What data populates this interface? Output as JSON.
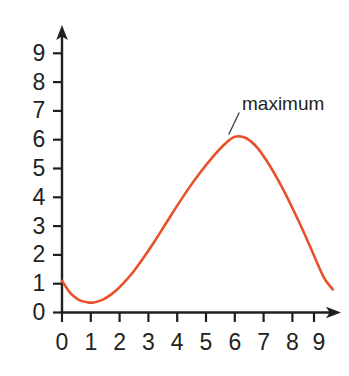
{
  "chart_data": {
    "type": "line",
    "title": "",
    "xlabel": "",
    "ylabel": "",
    "xlim": [
      0,
      9.6
    ],
    "ylim": [
      0,
      9.6
    ],
    "grid": false,
    "legend": "none",
    "x_ticks": [
      "0",
      "1",
      "2",
      "3",
      "4",
      "5",
      "6",
      "7",
      "8",
      "9"
    ],
    "y_ticks": [
      "0",
      "1",
      "2",
      "3",
      "4",
      "5",
      "6",
      "7",
      "8",
      "9"
    ],
    "x_tick_values": [
      0,
      1,
      2,
      3,
      4,
      5,
      6,
      7,
      8,
      9
    ],
    "y_tick_values": [
      0,
      1,
      2,
      3,
      4,
      5,
      6,
      7,
      8,
      9
    ],
    "series": [
      {
        "name": "curve",
        "color": "#E8502A",
        "x": [
          0.0,
          0.3,
          0.6,
          0.9,
          1.1,
          1.4,
          1.7,
          2.0,
          2.4,
          2.8,
          3.2,
          3.6,
          4.0,
          4.4,
          4.8,
          5.2,
          5.6,
          6.0,
          6.4,
          6.8,
          7.2,
          7.6,
          8.0,
          8.4,
          8.8,
          9.1,
          9.4
        ],
        "y": [
          1.1,
          0.66,
          0.43,
          0.35,
          0.35,
          0.44,
          0.62,
          0.88,
          1.32,
          1.86,
          2.45,
          3.08,
          3.71,
          4.31,
          4.86,
          5.36,
          5.8,
          6.1,
          6.05,
          5.7,
          5.12,
          4.42,
          3.63,
          2.78,
          1.86,
          1.2,
          0.8
        ]
      }
    ],
    "annotations": [
      {
        "text": "maximum",
        "target_x": 6.0,
        "target_y": 6.1,
        "label_x": 6.3,
        "label_y": 7.05
      }
    ]
  },
  "annotation_text": {
    "maximum": "maximum"
  },
  "axis_labels": {
    "y0": "0",
    "y1": "1",
    "y2": "2",
    "y3": "3",
    "y4": "4",
    "y5": "5",
    "y6": "6",
    "y7": "7",
    "y8": "8",
    "y9": "9",
    "x0": "0",
    "x1": "1",
    "x2": "2",
    "x3": "3",
    "x4": "4",
    "x5": "5",
    "x6": "6",
    "x7": "7",
    "x8": "8",
    "x9": "9"
  },
  "colors": {
    "curve": "#E8502A",
    "axis": "#231f20",
    "text": "#231f20",
    "leader": "#3b4651",
    "background": "#ffffff"
  }
}
